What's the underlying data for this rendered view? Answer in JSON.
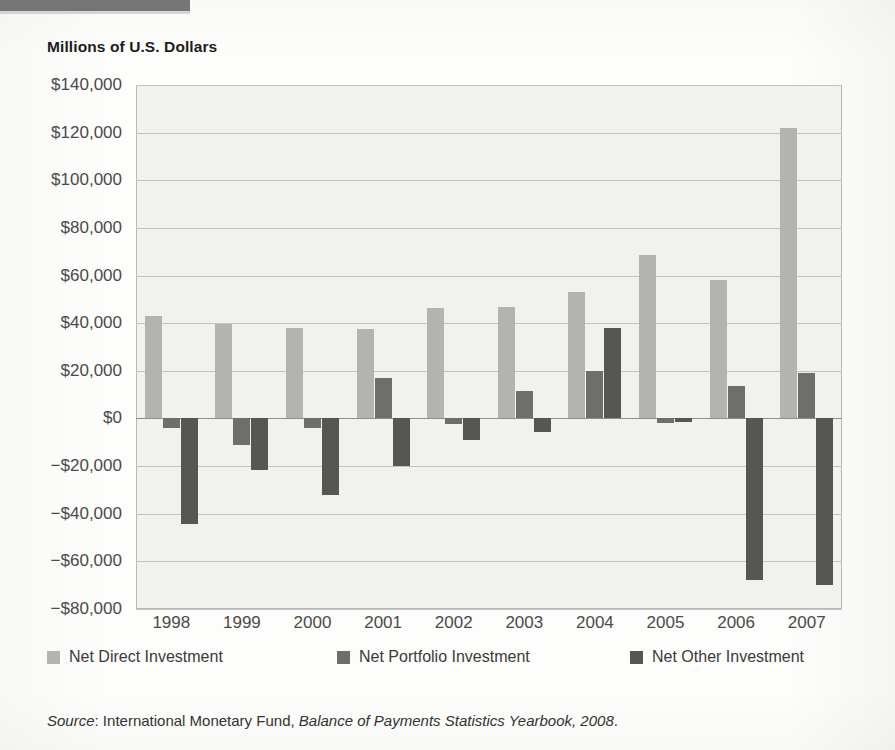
{
  "page": {
    "title": "Millions of U.S. Dollars",
    "source_prefix": "Source",
    "source_body": ": International Monetary Fund, ",
    "source_italic_title": "Balance of Payments Statistics Yearbook, 2008",
    "source_end": "."
  },
  "colors": {
    "direct": "#b3b3b1",
    "portfolio": "#6e6e6c",
    "other": "#565654",
    "plot_background": "#f1f1ef",
    "gridline": "#c2c2c2",
    "axis": "#8e8e8e"
  },
  "legend": {
    "position": "bottom",
    "items": [
      {
        "label": "Net Direct Investment",
        "key": "direct"
      },
      {
        "label": "Net Portfolio Investment",
        "key": "portfolio"
      },
      {
        "label": "Net Other Investment",
        "key": "other"
      }
    ]
  },
  "chart_data": {
    "type": "bar",
    "title": "Millions of U.S. Dollars",
    "xlabel": "",
    "ylabel": "Millions of U.S. Dollars",
    "grid": true,
    "ylim": [
      -80000,
      140000
    ],
    "ytick_values": [
      140000,
      120000,
      100000,
      80000,
      60000,
      40000,
      20000,
      0,
      -20000,
      -40000,
      -60000,
      -80000
    ],
    "ytick_labels": [
      "$140,000",
      "$120,000",
      "$100,000",
      "$80,000",
      "$60,000",
      "$40,000",
      "$20,000",
      "$0",
      "−$20,000",
      "−$40,000",
      "−$60,000",
      "−$80,000"
    ],
    "categories": [
      "1998",
      "1999",
      "2000",
      "2001",
      "2002",
      "2003",
      "2004",
      "2005",
      "2006",
      "2007"
    ],
    "series": [
      {
        "name": "Net Direct Investment",
        "color": "#b3b3b1",
        "values": [
          43000,
          39500,
          38000,
          37500,
          46500,
          47000,
          53000,
          68500,
          58000,
          122000
        ]
      },
      {
        "name": "Net Portfolio Investment",
        "color": "#6e6e6c",
        "values": [
          -4000,
          -11000,
          -4000,
          17000,
          -2500,
          11500,
          20000,
          -2000,
          13500,
          19000
        ]
      },
      {
        "name": "Net Other Investment",
        "color": "#565654",
        "values": [
          -44500,
          -21500,
          -32000,
          -20000,
          -9000,
          -5500,
          38000,
          -1500,
          -68000,
          -70000
        ]
      }
    ]
  }
}
